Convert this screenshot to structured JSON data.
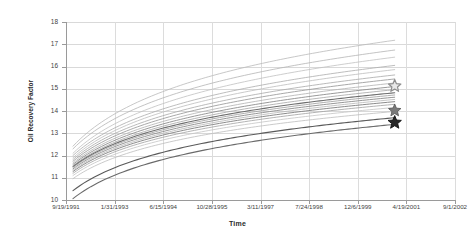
{
  "chart_data": {
    "type": "line",
    "title": "",
    "xlabel": "Time",
    "ylabel": "Oil Recovery Factor",
    "grid": true,
    "legend": "none",
    "ylim": [
      10,
      18
    ],
    "ytick_labels": [
      "10",
      "11",
      "12",
      "13",
      "14",
      "15",
      "16",
      "17",
      "18"
    ],
    "ytick_values": [
      10,
      11,
      12,
      13,
      14,
      15,
      16,
      17,
      18
    ],
    "xtick_labels": [
      "9/19/1991",
      "1/31/1993",
      "6/15/1994",
      "10/28/1995",
      "3/11/1997",
      "7/24/1998",
      "12/6/1999",
      "4/19/2001",
      "9/1/2002"
    ],
    "x_fraction_ticks": [
      0.0,
      0.125,
      0.25,
      0.375,
      0.5,
      0.625,
      0.75,
      0.875,
      1.0
    ],
    "x_start_fraction": 0.018,
    "x_end_fraction": 0.845,
    "series": [
      {
        "name": "realization-01",
        "color": "#b9b9b9",
        "width": 0.8,
        "y_start": 12.42,
        "y_end": 17.18,
        "curvature": 0.62
      },
      {
        "name": "realization-02",
        "color": "#b4b4b4",
        "width": 0.8,
        "y_start": 12.3,
        "y_end": 16.74,
        "curvature": 0.62
      },
      {
        "name": "realization-03",
        "color": "#c0c0c0",
        "width": 0.8,
        "y_start": 12.1,
        "y_end": 16.42,
        "curvature": 0.63
      },
      {
        "name": "realization-04",
        "color": "#acacac",
        "width": 0.8,
        "y_start": 12.0,
        "y_end": 16.05,
        "curvature": 0.63
      },
      {
        "name": "realization-05",
        "color": "#bcbcbc",
        "width": 0.8,
        "y_start": 11.9,
        "y_end": 15.86,
        "curvature": 0.64
      },
      {
        "name": "realization-06",
        "color": "#a8a8a8",
        "width": 0.8,
        "y_start": 11.82,
        "y_end": 15.62,
        "curvature": 0.64
      },
      {
        "name": "realization-07",
        "color": "#9e9e9e",
        "width": 0.9,
        "y_start": 11.74,
        "y_end": 15.44,
        "curvature": 0.64
      },
      {
        "name": "realization-08",
        "color": "#b0b0b0",
        "width": 0.8,
        "y_start": 11.66,
        "y_end": 15.26,
        "curvature": 0.65
      },
      {
        "name": "realization-09",
        "color": "#8d8d8d",
        "width": 0.9,
        "y_start": 11.6,
        "y_end": 15.1,
        "curvature": 0.65
      },
      {
        "name": "realization-10",
        "color": "#a4a4a4",
        "width": 0.8,
        "y_start": 11.54,
        "y_end": 14.96,
        "curvature": 0.65
      },
      {
        "name": "realization-11",
        "color": "#6e6e6e",
        "width": 1.1,
        "y_start": 11.5,
        "y_end": 14.82,
        "curvature": 0.66
      },
      {
        "name": "realization-12",
        "color": "#9a9a9a",
        "width": 0.8,
        "y_start": 11.46,
        "y_end": 14.72,
        "curvature": 0.66
      },
      {
        "name": "realization-13",
        "color": "#8a8a8a",
        "width": 0.9,
        "y_start": 11.4,
        "y_end": 14.62,
        "curvature": 0.66
      },
      {
        "name": "realization-14",
        "color": "#b6b6b6",
        "width": 0.8,
        "y_start": 11.34,
        "y_end": 14.52,
        "curvature": 0.66
      },
      {
        "name": "realization-15",
        "color": "#7e7e7e",
        "width": 0.9,
        "y_start": 11.28,
        "y_end": 14.42,
        "curvature": 0.67
      },
      {
        "name": "realization-16",
        "color": "#a0a0a0",
        "width": 0.8,
        "y_start": 11.2,
        "y_end": 14.3,
        "curvature": 0.67
      },
      {
        "name": "realization-17",
        "color": "#c4c4c4",
        "width": 0.8,
        "y_start": 11.1,
        "y_end": 14.16,
        "curvature": 0.67
      },
      {
        "name": "realization-18",
        "color": "#bdbdbd",
        "width": 0.8,
        "y_start": 10.96,
        "y_end": 13.98,
        "curvature": 0.68
      },
      {
        "name": "realization-19",
        "color": "#5a5a5a",
        "width": 1.1,
        "y_start": 10.42,
        "y_end": 13.7,
        "curvature": 0.7
      },
      {
        "name": "realization-20",
        "color": "#6a6a6a",
        "width": 1.1,
        "y_start": 10.06,
        "y_end": 13.4,
        "curvature": 0.71
      }
    ],
    "markers": [
      {
        "name": "star-marker-upper",
        "style": "star-hollow",
        "fill": "#e8e8e8",
        "stroke": "#8c8c8c",
        "x_fraction": 0.845,
        "y_value": 15.12,
        "size": 13
      },
      {
        "name": "star-marker-middle",
        "style": "star-filled",
        "fill": "#7a7a7a",
        "stroke": "#5a5a5a",
        "x_fraction": 0.845,
        "y_value": 14.02,
        "size": 13
      },
      {
        "name": "star-marker-lower",
        "style": "star-filled",
        "fill": "#262626",
        "stroke": "#111111",
        "x_fraction": 0.845,
        "y_value": 13.48,
        "size": 14
      }
    ]
  }
}
